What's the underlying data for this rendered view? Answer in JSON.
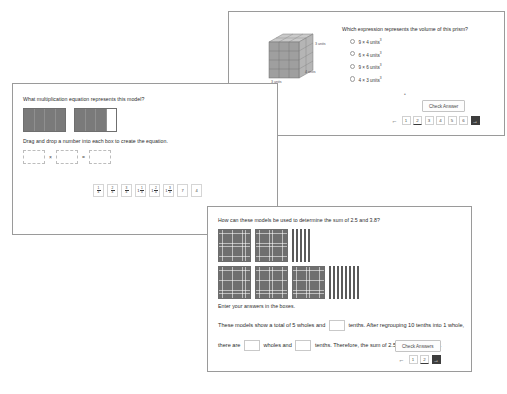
{
  "background_color": "#ffffff",
  "panels": [
    {
      "id": "volume",
      "question": "Which expression represents the volume of this prism?",
      "figure": {
        "name": "rectangular-prism-unit-cubes",
        "labels": [
          "3 units",
          "4 units",
          "3 units"
        ]
      },
      "options": [
        "9 × 4 units",
        "6 × 4 units",
        "9 × 6 units",
        "4 × 3 units"
      ],
      "option_exponent": "3",
      "check_label": "Check Answer",
      "pagination": {
        "prev": "←",
        "pages": [
          "1",
          "2",
          "3",
          "4",
          "5",
          "6"
        ],
        "active": "2",
        "next": "→"
      }
    },
    {
      "id": "multiplication",
      "question": "What multiplication equation represents this model?",
      "instruction": "Drag and drop a number into each box to create the equation.",
      "operators": {
        "times": "×",
        "equals": "="
      },
      "tiles": [
        {
          "type": "fraction",
          "num": "1",
          "den": "4"
        },
        {
          "type": "fraction",
          "num": "2",
          "den": "4"
        },
        {
          "type": "fraction",
          "num": "3",
          "den": "4"
        },
        {
          "type": "mixed",
          "whole": "1",
          "num": "1",
          "den": "4"
        },
        {
          "type": "mixed",
          "whole": "1",
          "num": "2",
          "den": "4"
        },
        {
          "type": "mixed",
          "whole": "1",
          "num": "3",
          "den": "4"
        },
        {
          "type": "whole",
          "value": "7"
        },
        {
          "type": "whole",
          "value": "4"
        }
      ],
      "model": {
        "boxes": 2,
        "segments_per_box": 4,
        "shaded_per_box": [
          4,
          3
        ]
      }
    },
    {
      "id": "decimal-sum",
      "question": "How can these models be used to determine the sum of 2.5 and 3.8?",
      "instruction": "Enter your answers in the boxes.",
      "models": [
        {
          "wholes": 2,
          "tenths": 5
        },
        {
          "wholes": 3,
          "tenths": 8
        }
      ],
      "sentence_part_1": "These models show a total of 5 wholes and",
      "sentence_part_2": "tenths. After regrouping 10 tenths into 1",
      "sentence_part_3": "whole, there are",
      "sentence_part_4": "wholes and",
      "sentence_part_5": "tenths. Therefore, the sum of 2.5 and 3.8 is",
      "sentence_part_6": ".",
      "check_label": "Check Answers",
      "pagination": {
        "prev": "←",
        "pages": [
          "1",
          "2"
        ],
        "active": "2",
        "next": "→"
      }
    }
  ]
}
